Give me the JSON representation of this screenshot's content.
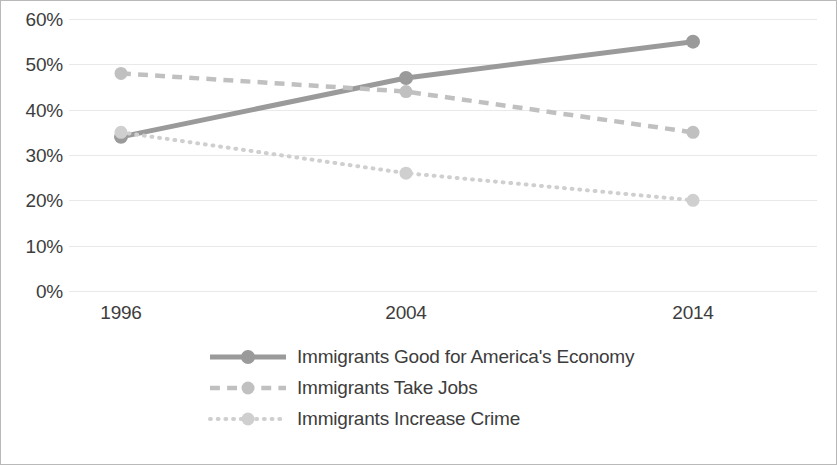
{
  "chart_data": {
    "type": "line",
    "title": "",
    "subtitle": "",
    "xlabel": "",
    "ylabel": "",
    "categories": [
      "1996",
      "2004",
      "2014"
    ],
    "x_tick_labels": [
      "1996",
      "2004",
      "2014"
    ],
    "y_tick_labels": [
      "60%",
      "50%",
      "40%",
      "30%",
      "20%",
      "10%",
      "0%"
    ],
    "y_tick_values": [
      60,
      50,
      40,
      30,
      20,
      10,
      0
    ],
    "ylim": [
      0,
      60
    ],
    "y_unit": "%",
    "grid": "horizontal",
    "legend_position": "bottom",
    "series": [
      {
        "name": "Immigrants Good for America's Economy",
        "values": [
          34,
          47,
          55
        ],
        "line_style": "solid",
        "color": "#9a9a9a",
        "marker": "circle"
      },
      {
        "name": "Immigrants Take Jobs",
        "values": [
          48,
          44,
          35
        ],
        "line_style": "dashed",
        "color": "#c0c0c0",
        "marker": "circle"
      },
      {
        "name": "Immigrants Increase Crime",
        "values": [
          35,
          26,
          20
        ],
        "line_style": "dotted",
        "color": "#cfcfcf",
        "marker": "circle"
      }
    ]
  },
  "colors": {
    "frame_border": "#b9b9b9",
    "gridline": "#e9e9e9",
    "text": "#3d3d3d",
    "background": "#ffffff"
  }
}
